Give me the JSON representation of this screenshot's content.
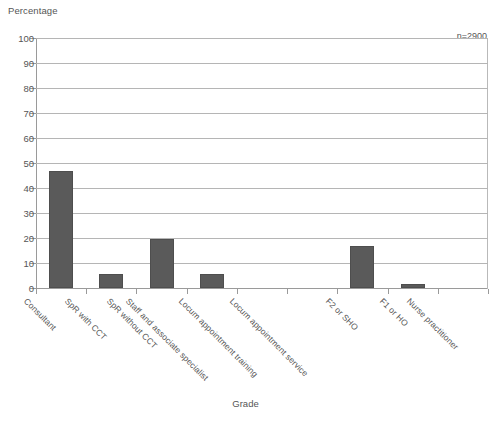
{
  "chart_data": {
    "type": "bar",
    "title": "",
    "ylabel": "Percentage",
    "xlabel": "Grade",
    "annotation": "n=2900",
    "categories": [
      "Consultant",
      "SpR with CCT",
      "SpR without CCT",
      "Staff and associate specialist",
      "Locum appointment training",
      "Locum appointment service",
      "F2 or SHO",
      "F1 or HO",
      "Nurse practitioner"
    ],
    "values": [
      47,
      5.5,
      19.5,
      5.5,
      0,
      0,
      17,
      1.5,
      0
    ],
    "ylim": [
      0,
      100
    ],
    "yticks": [
      0,
      10,
      20,
      30,
      40,
      50,
      60,
      70,
      80,
      90,
      100
    ],
    "ytick_labels": [
      "0",
      "10",
      "20",
      "30",
      "40",
      "50",
      "60",
      "70",
      "80",
      "90",
      "100"
    ],
    "grid": true,
    "legend": "none",
    "bar_color": "#5a5a5a",
    "grid_color": "#b5b5b5",
    "axis_color": "#9a9a9a"
  }
}
